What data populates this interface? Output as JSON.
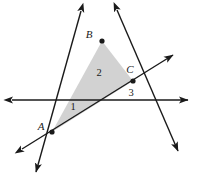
{
  "figure": {
    "kind": "geometry-diagram",
    "width": 200,
    "height": 179,
    "background_color": "#ffffff",
    "stroke_color": "#1a1a1a",
    "fill_color": "#d2d2d2",
    "fill_opacity": 1
  },
  "labels": {
    "vertex_a": "A",
    "vertex_b": "B",
    "vertex_c": "C",
    "angle_1": "1",
    "angle_2": "2",
    "angle_3": "3"
  },
  "points": {
    "A": {
      "x": 52,
      "y": 132,
      "label": "A",
      "label_x": 41,
      "label_y": 130
    },
    "B": {
      "x": 102,
      "y": 41,
      "label": "B",
      "label_x": 89,
      "label_y": 38
    },
    "C": {
      "x": 133,
      "y": 81,
      "label": "C",
      "label_x": 130,
      "label_y": 73
    }
  },
  "angle_marks": [
    {
      "name": "angle-1",
      "text": "1",
      "x": 73,
      "y": 110
    },
    {
      "name": "angle-2",
      "text": "2",
      "x": 99,
      "y": 76
    },
    {
      "name": "angle-3",
      "text": "3",
      "x": 131,
      "y": 96
    }
  ],
  "triangle": {
    "name": "triangle-ABC",
    "points": "52,132 102,41 133,81",
    "filled": true
  },
  "lines": [
    {
      "name": "horizontal-transversal",
      "x1": 12,
      "y1": 100,
      "x2": 188,
      "y2": 100,
      "arrow_start": true,
      "arrow_end": true
    },
    {
      "name": "line-through-A-and-B",
      "x1": 81,
      "y1": 11,
      "x2": 36,
      "y2": 172,
      "arrow_start": true,
      "arrow_end": true
    },
    {
      "name": "line-through-A-and-C",
      "x1": 22,
      "y1": 149,
      "x2": 173,
      "y2": 55,
      "arrow_start": true,
      "arrow_end": true
    },
    {
      "name": "line-through-B-and-C",
      "x1": 117,
      "y1": 10,
      "x2": 178,
      "y2": 151,
      "arrow_start": true,
      "arrow_end": true
    }
  ]
}
